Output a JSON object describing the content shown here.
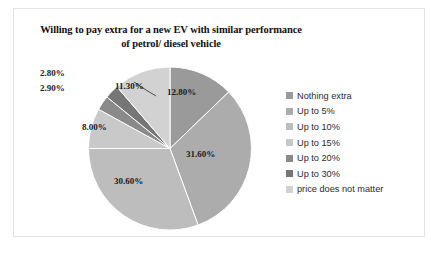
{
  "chart_data": {
    "type": "pie",
    "title": "Willing to pay extra for a new EV with similar performance of petrol/ diesel vehicle",
    "title_line1": "Willing to pay extra for a new EV with similar performance of",
    "title_line2": "petrol/ diesel vehicle",
    "categories": [
      "Nothing extra",
      "Up to 5%",
      "Up to 10%",
      "Up to 15%",
      "Up to 20%",
      "Up to 30%",
      "price does not matter"
    ],
    "values": [
      12.8,
      31.6,
      30.6,
      8.0,
      2.9,
      2.8,
      11.3
    ],
    "value_labels": [
      "12.80%",
      "31.60%",
      "30.60%",
      "8.00%",
      "2.90%",
      "2.80%",
      "11.30%"
    ],
    "colors": [
      "#9a9a9a",
      "#acacac",
      "#bdbdbd",
      "#c9c9c9",
      "#8a8a8a",
      "#767676",
      "#d2d2d2"
    ],
    "legend_position": "right",
    "start_angle_deg": 0,
    "direction": "clockwise",
    "grid": false,
    "xlabel": "",
    "ylabel": ""
  },
  "legend": {
    "items": [
      {
        "label": "Nothing extra",
        "color": "#9a9a9a"
      },
      {
        "label": "Up to 5%",
        "color": "#acacac"
      },
      {
        "label": "Up to 10%",
        "color": "#bdbdbd"
      },
      {
        "label": "Up to 15%",
        "color": "#c9c9c9"
      },
      {
        "label": "Up to 20%",
        "color": "#8a8a8a"
      },
      {
        "label": "Up to 30%",
        "color": "#767676"
      },
      {
        "label": "price does not matter",
        "color": "#d2d2d2"
      }
    ]
  },
  "labels": {
    "inside": [
      {
        "text": "12.80%",
        "left": 93,
        "top": 21
      },
      {
        "text": "31.60%",
        "left": 112,
        "top": 83
      },
      {
        "text": "30.60%",
        "left": 40,
        "top": 110
      },
      {
        "text": "8.00%",
        "left": 8,
        "top": 56
      },
      {
        "text": "11.30%",
        "left": 41,
        "top": 15
      }
    ],
    "outside": [
      {
        "text": "2.80%",
        "left": -34,
        "top": 2
      },
      {
        "text": "2.90%",
        "left": -34,
        "top": 17
      }
    ]
  }
}
